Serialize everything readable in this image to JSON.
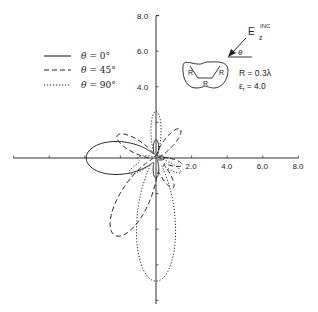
{
  "chart_data": {
    "type": "line",
    "subtype": "polar-scattering-pattern",
    "title": "",
    "xlabel": "",
    "ylabel": "",
    "xlim": [
      -8.0,
      8.0
    ],
    "ylim": [
      -8.0,
      8.0
    ],
    "grid": false,
    "x_tick_labels": [
      "2.0",
      "4.0",
      "6.0",
      "8.0"
    ],
    "x_ticks": [
      2.0,
      4.0,
      6.0,
      8.0
    ],
    "y_tick_labels": [
      "4.0",
      "6.0",
      "8.0"
    ],
    "y_ticks": [
      4.0,
      6.0,
      8.0
    ],
    "legend_position": "top-left",
    "legend": [
      {
        "label_symbol": "θ",
        "label_value": "=   0°",
        "style": "solid"
      },
      {
        "label_symbol": "θ",
        "label_value": "= 45°",
        "style": "dashed"
      },
      {
        "label_symbol": "θ",
        "label_value": "= 90°",
        "style": "dotted"
      }
    ],
    "series": [
      {
        "name": "θ = 0°",
        "style": "solid",
        "lobes": [
          {
            "angle_deg": 180,
            "magnitude": 3.8,
            "width_deg": 36
          },
          {
            "angle_deg": 90,
            "magnitude": 0.9,
            "width_deg": 20
          },
          {
            "angle_deg": -90,
            "magnitude": 1.0,
            "width_deg": 20
          },
          {
            "angle_deg": 0,
            "magnitude": 0.35,
            "width_deg": 30
          }
        ]
      },
      {
        "name": "θ = 45°",
        "style": "dashed",
        "lobes": [
          {
            "angle_deg": -118,
            "magnitude": 4.8,
            "width_deg": 26
          },
          {
            "angle_deg": 150,
            "magnitude": 2.4,
            "width_deg": 22
          },
          {
            "angle_deg": 50,
            "magnitude": 2.0,
            "width_deg": 20
          },
          {
            "angle_deg": -60,
            "magnitude": 1.8,
            "width_deg": 18
          },
          {
            "angle_deg": -15,
            "magnitude": 1.4,
            "width_deg": 18
          }
        ]
      },
      {
        "name": "θ = 90°",
        "style": "dotted",
        "lobes": [
          {
            "angle_deg": -90,
            "magnitude": 6.8,
            "width_deg": 24
          },
          {
            "angle_deg": 90,
            "magnitude": 2.5,
            "width_deg": 16
          },
          {
            "angle_deg": -150,
            "magnitude": 1.6,
            "width_deg": 16
          },
          {
            "angle_deg": -30,
            "magnitude": 1.5,
            "width_deg": 16
          },
          {
            "angle_deg": 180,
            "magnitude": 0.9,
            "width_deg": 18
          }
        ]
      }
    ],
    "annotations": {
      "incident_field_label": "E",
      "incident_field_superscript": "INC",
      "incident_field_subscript": "z",
      "incident_angle_symbol": "θ",
      "shape_labels": [
        "R",
        "R",
        "R"
      ],
      "param_radius": "R = 0.3λ",
      "param_permittivity_symbol": "ε",
      "param_permittivity_subscript": "r",
      "param_permittivity_value": "= 4.0"
    }
  }
}
